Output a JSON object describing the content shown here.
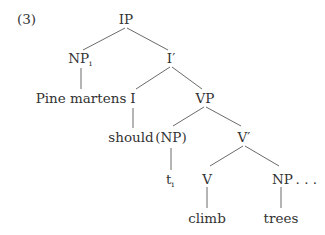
{
  "example_number": "(3)",
  "tree": {
    "nodes": {
      "ip": {
        "label": "IP"
      },
      "np_subject": {
        "label": "NP",
        "subscript": "i"
      },
      "i_bar": {
        "label": "I′"
      },
      "pine_martens": {
        "label": "Pine martens"
      },
      "i": {
        "label": "I"
      },
      "vp": {
        "label": "VP"
      },
      "should": {
        "label": "should"
      },
      "np_trace_parent": {
        "label": "(NP)"
      },
      "v_bar": {
        "label": "V′"
      },
      "trace": {
        "label": "t",
        "subscript": "i"
      },
      "v": {
        "label": "V"
      },
      "np_object": {
        "label": "NP",
        "suffix": " . . ."
      },
      "climb": {
        "label": "climb"
      },
      "trees": {
        "label": "trees"
      }
    },
    "edges": [
      [
        "ip",
        "np_subject"
      ],
      [
        "ip",
        "i_bar"
      ],
      [
        "np_subject",
        "pine_martens"
      ],
      [
        "i_bar",
        "i"
      ],
      [
        "i_bar",
        "vp"
      ],
      [
        "i",
        "should"
      ],
      [
        "vp",
        "np_trace_parent"
      ],
      [
        "vp",
        "v_bar"
      ],
      [
        "np_trace_parent",
        "trace"
      ],
      [
        "v_bar",
        "v"
      ],
      [
        "v_bar",
        "np_object"
      ],
      [
        "v",
        "climb"
      ],
      [
        "np_object",
        "trees"
      ]
    ]
  },
  "colors": {
    "text": "#333333",
    "lines": "#6a6a6a",
    "background": "#ffffff"
  }
}
